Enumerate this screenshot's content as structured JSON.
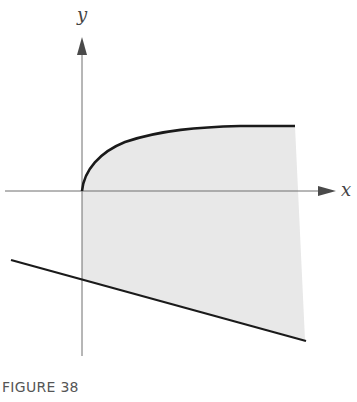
{
  "figure": {
    "caption": "FIGURE 38",
    "axes": {
      "x_label": "x",
      "y_label": "y"
    },
    "colors": {
      "axis": "#6e6e6e",
      "curve": "#1a1a1a",
      "line": "#1a1a1a",
      "shading": "#e8e8e8",
      "caption": "#555555"
    },
    "elements": [
      {
        "name": "upper-curve",
        "description": "square-root-like curve starting at origin and flattening to the right"
      },
      {
        "name": "lower-line",
        "description": "straight line with negative slope below the x-axis"
      },
      {
        "name": "shaded-region",
        "description": "region between curve and line from y-axis to right boundary"
      }
    ]
  }
}
